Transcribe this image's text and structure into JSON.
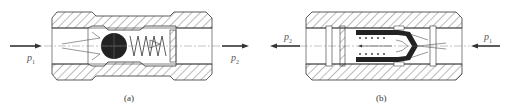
{
  "figure_a": {
    "caption": "(a)",
    "type": "ball check valve",
    "inlet_label": "p",
    "inlet_sub": "1",
    "outlet_label": "p",
    "outlet_sub": "2",
    "flow_direction": "left-to-right"
  },
  "figure_b": {
    "caption": "(b)",
    "type": "poppet check valve",
    "inlet_label": "p",
    "inlet_sub": "1",
    "outlet_label": "p",
    "outlet_sub": "2",
    "flow_direction": "right-to-left"
  },
  "colors": {
    "line": "#333333",
    "hatch": "#555555",
    "solid_part": "#222222",
    "background": "#ffffff"
  }
}
